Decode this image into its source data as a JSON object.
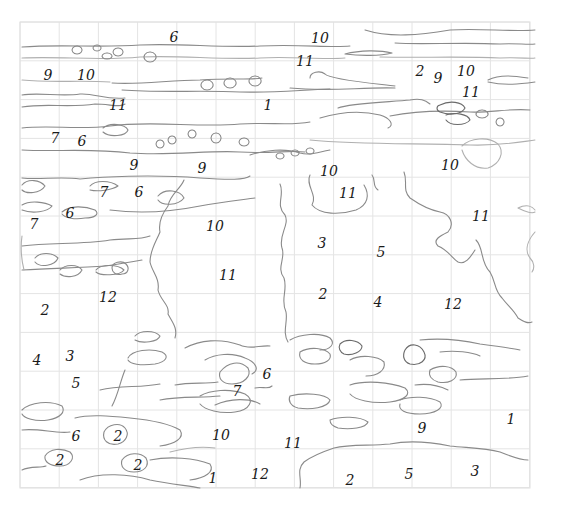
{
  "drawing": {
    "title": "Paint-by-numbers water lilies line drawing",
    "grid": {
      "x0": 20,
      "y0": 22,
      "cols": 13,
      "rows": 12,
      "cell_w": 39.2,
      "cell_h": 38.8,
      "line_color": "#e4e4e4"
    },
    "stroke_color": "#8a8a8a",
    "number_color": "#1a1a1a",
    "numbers": [
      {
        "label": "6",
        "x": 174,
        "y": 42
      },
      {
        "label": "10",
        "x": 320,
        "y": 43
      },
      {
        "label": "11",
        "x": 305,
        "y": 66
      },
      {
        "label": "9",
        "x": 48,
        "y": 80
      },
      {
        "label": "10",
        "x": 86,
        "y": 80
      },
      {
        "label": "2",
        "x": 420,
        "y": 76
      },
      {
        "label": "9",
        "x": 438,
        "y": 83
      },
      {
        "label": "10",
        "x": 466,
        "y": 76
      },
      {
        "label": "11",
        "x": 118,
        "y": 110
      },
      {
        "label": "1",
        "x": 268,
        "y": 110
      },
      {
        "label": "11",
        "x": 471,
        "y": 97
      },
      {
        "label": "7",
        "x": 55,
        "y": 143
      },
      {
        "label": "6",
        "x": 82,
        "y": 146
      },
      {
        "label": "9",
        "x": 134,
        "y": 170
      },
      {
        "label": "9",
        "x": 202,
        "y": 173
      },
      {
        "label": "10",
        "x": 329,
        "y": 176
      },
      {
        "label": "10",
        "x": 450,
        "y": 170
      },
      {
        "label": "7",
        "x": 104,
        "y": 197
      },
      {
        "label": "6",
        "x": 139,
        "y": 197
      },
      {
        "label": "11",
        "x": 348,
        "y": 198
      },
      {
        "label": "7",
        "x": 34,
        "y": 229
      },
      {
        "label": "6",
        "x": 70,
        "y": 218
      },
      {
        "label": "10",
        "x": 215,
        "y": 231
      },
      {
        "label": "11",
        "x": 481,
        "y": 221
      },
      {
        "label": "3",
        "x": 322,
        "y": 248
      },
      {
        "label": "5",
        "x": 381,
        "y": 257
      },
      {
        "label": "11",
        "x": 228,
        "y": 280
      },
      {
        "label": "2",
        "x": 323,
        "y": 299
      },
      {
        "label": "4",
        "x": 378,
        "y": 307
      },
      {
        "label": "12",
        "x": 453,
        "y": 309
      },
      {
        "label": "2",
        "x": 45,
        "y": 315
      },
      {
        "label": "12",
        "x": 108,
        "y": 302
      },
      {
        "label": "4",
        "x": 37,
        "y": 365
      },
      {
        "label": "3",
        "x": 70,
        "y": 361
      },
      {
        "label": "6",
        "x": 267,
        "y": 379
      },
      {
        "label": "5",
        "x": 76,
        "y": 388
      },
      {
        "label": "7",
        "x": 237,
        "y": 396
      },
      {
        "label": "1",
        "x": 511,
        "y": 424
      },
      {
        "label": "9",
        "x": 422,
        "y": 433
      },
      {
        "label": "6",
        "x": 76,
        "y": 441
      },
      {
        "label": "2",
        "x": 118,
        "y": 441
      },
      {
        "label": "10",
        "x": 221,
        "y": 440
      },
      {
        "label": "11",
        "x": 293,
        "y": 448
      },
      {
        "label": "2",
        "x": 60,
        "y": 465
      },
      {
        "label": "2",
        "x": 138,
        "y": 470
      },
      {
        "label": "1",
        "x": 213,
        "y": 483
      },
      {
        "label": "12",
        "x": 260,
        "y": 479
      },
      {
        "label": "2",
        "x": 350,
        "y": 485
      },
      {
        "label": "5",
        "x": 409,
        "y": 479
      },
      {
        "label": "3",
        "x": 475,
        "y": 476
      }
    ]
  }
}
